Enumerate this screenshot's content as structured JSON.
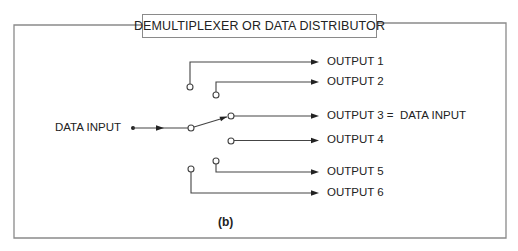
{
  "title": "DEMULTIPLEXER OR DATA DISTRIBUTOR",
  "input_label": "DATA INPUT",
  "outputs": [
    {
      "label": "OUTPUT 1"
    },
    {
      "label": "OUTPUT 2"
    },
    {
      "label": "OUTPUT 3 =  DATA INPUT"
    },
    {
      "label": "OUTPUT 4"
    },
    {
      "label": "OUTPUT 5"
    },
    {
      "label": "OUTPUT 6"
    }
  ],
  "caption": "(b)",
  "switch_state": {
    "selected_output": 3
  },
  "colors": {
    "frame": "#8a8a8a",
    "wire": "#444444",
    "text": "#222222"
  }
}
